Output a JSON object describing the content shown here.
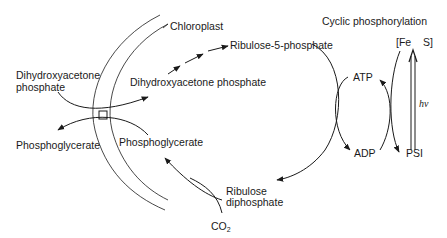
{
  "diagram": {
    "title": "Cyclic phosphorylation",
    "labels": {
      "chloroplast": "Chloroplast",
      "cyclic_phosphorylation": "Cyclic phosphorylation",
      "dhap_outside_line1": "Dihydroxyacetone",
      "dhap_outside_line2": "phosphate",
      "dhap_inside": "Dihydroxyacetone phosphate",
      "ribulose_5_phosphate": "Ribulose-5-phosphate",
      "pga_outside": "Phosphoglycerate",
      "pga_inside": "Phosphoglycerate",
      "rudp_line1": "Ribulose",
      "rudp_line2": "diphosphate",
      "co2_main": "CO",
      "co2_sub": "2",
      "atp": "ATP",
      "adp": "ADP",
      "psi": "PSI",
      "fes_open": "[Fe",
      "fes_close": "S]",
      "hv": "hv"
    },
    "colors": {
      "ink": "#1a1a1a",
      "background": "#ffffff"
    }
  }
}
